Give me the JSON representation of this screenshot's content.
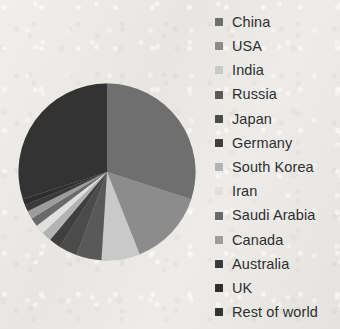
{
  "chart_data": {
    "type": "pie",
    "title": "",
    "subtitle": "",
    "xlabel": "",
    "ylabel": "",
    "grid": false,
    "legend_position": "right",
    "start_angle_deg": 0,
    "direction": "clockwise",
    "categories": [
      "China",
      "USA",
      "India",
      "Russia",
      "Japan",
      "Germany",
      "South Korea",
      "Iran",
      "Saudi Arabia",
      "Canada",
      "Australia",
      "UK",
      "Rest of world"
    ],
    "values": [
      30.0,
      14.0,
      7.0,
      4.6,
      3.4,
      2.1,
      1.8,
      1.7,
      1.6,
      1.5,
      1.2,
      1.1,
      30.0
    ],
    "colors": [
      "#6f6f6f",
      "#8c8c8c",
      "#c9c9c9",
      "#595959",
      "#4b4b4b",
      "#3f3f3f",
      "#b3b3b3",
      "#e0e0e0",
      "#6a6a6a",
      "#9d9d9d",
      "#3a3a3a",
      "#2e2e2e",
      "#333333"
    ],
    "legend": [
      {
        "label": "China",
        "color": "#6f6f6f"
      },
      {
        "label": "USA",
        "color": "#8c8c8c"
      },
      {
        "label": "India",
        "color": "#c9c9c9"
      },
      {
        "label": "Russia",
        "color": "#595959"
      },
      {
        "label": "Japan",
        "color": "#4b4b4b"
      },
      {
        "label": "Germany",
        "color": "#3f3f3f"
      },
      {
        "label": "South Korea",
        "color": "#b3b3b3"
      },
      {
        "label": "Iran",
        "color": "#e0e0e0"
      },
      {
        "label": "Saudi Arabia",
        "color": "#6a6a6a"
      },
      {
        "label": "Canada",
        "color": "#9d9d9d"
      },
      {
        "label": "Australia",
        "color": "#3a3a3a"
      },
      {
        "label": "UK",
        "color": "#2e2e2e"
      },
      {
        "label": "Rest of world",
        "color": "#333333"
      }
    ]
  },
  "page": {
    "background_color": "#ebe9e5",
    "text_color": "#2f2f2f"
  }
}
